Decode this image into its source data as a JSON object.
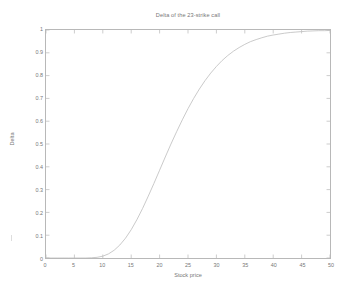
{
  "figure": {
    "width": 351,
    "height": 292,
    "background": "#ffffff",
    "axis_color": "#b8b8b8",
    "text_color": "#777777",
    "curve_color": "#bdbdbd"
  },
  "chart_data": {
    "type": "line",
    "title": "Delta of the 23-strike call",
    "xlabel": "Stock price",
    "ylabel": "Delta",
    "xlim": [
      0,
      50
    ],
    "ylim": [
      0,
      1
    ],
    "grid": false,
    "legend": null,
    "xticks": [
      0,
      5,
      10,
      15,
      20,
      25,
      30,
      35,
      40,
      45,
      50
    ],
    "xtick_labels": [
      "0",
      "5",
      "10",
      "15",
      "20",
      "25",
      "30",
      "35",
      "40",
      "45",
      "50"
    ],
    "yticks": [
      0,
      0.1,
      0.2,
      0.3,
      0.4,
      0.5,
      0.6,
      0.7,
      0.8,
      0.9,
      1
    ],
    "ytick_labels": [
      "0",
      "0.1",
      "0.2",
      "0.3",
      "0.4",
      "0.5",
      "0.6",
      "0.7",
      "0.8",
      "0.9",
      "1"
    ],
    "series": [
      {
        "name": "Delta",
        "x": [
          0,
          1,
          2,
          3,
          4,
          5,
          6,
          7,
          8,
          9,
          10,
          11,
          12,
          13,
          14,
          15,
          16,
          17,
          18,
          19,
          20,
          21,
          22,
          23,
          24,
          25,
          26,
          27,
          28,
          29,
          30,
          31,
          32,
          33,
          34,
          35,
          36,
          37,
          38,
          39,
          40,
          41,
          42,
          43,
          44,
          45,
          46,
          47,
          48,
          49,
          50
        ],
        "values": [
          0.0,
          0.0,
          0.0,
          0.0,
          0.0,
          0.0,
          0.0,
          0.0,
          0.001,
          0.003,
          0.008,
          0.018,
          0.034,
          0.057,
          0.087,
          0.124,
          0.168,
          0.217,
          0.271,
          0.327,
          0.385,
          0.443,
          0.5,
          0.554,
          0.606,
          0.655,
          0.7,
          0.741,
          0.778,
          0.811,
          0.84,
          0.866,
          0.888,
          0.907,
          0.923,
          0.937,
          0.949,
          0.958,
          0.966,
          0.973,
          0.978,
          0.982,
          0.986,
          0.989,
          0.991,
          0.993,
          0.995,
          0.996,
          0.997,
          0.997,
          0.998
        ]
      }
    ],
    "annotations": {
      "strike": 23,
      "description": "Black-Scholes call delta (N(d1)) as a function of stock price; sigmoid rising from 0 near price 10 to 1 near price 40, passing 0.5 around price 22."
    }
  }
}
